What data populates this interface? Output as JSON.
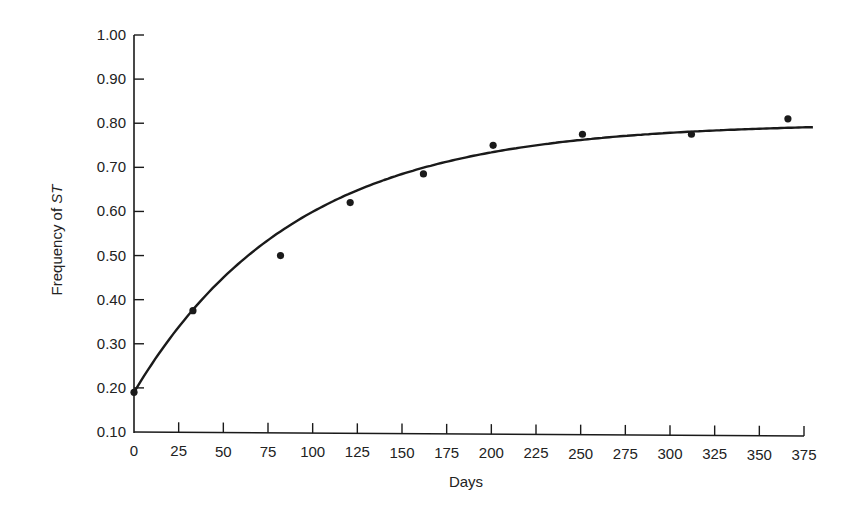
{
  "chart_data": {
    "type": "scatter",
    "title": "",
    "xlabel": "Days",
    "ylabel": "Frequency of ST",
    "ylabel_parts": {
      "prefix": "Frequency of ",
      "italic": "ST"
    },
    "xlim": [
      0,
      375
    ],
    "ylim": [
      0.1,
      1.0
    ],
    "grid": false,
    "legend": null,
    "x_ticks": [
      0,
      25,
      50,
      75,
      100,
      125,
      150,
      175,
      200,
      225,
      250,
      275,
      300,
      325,
      350,
      375
    ],
    "y_ticks": [
      "0.10",
      "0.20",
      "0.30",
      "0.40",
      "0.50",
      "0.60",
      "0.70",
      "0.80",
      "0.90",
      "1.00"
    ],
    "series": [
      {
        "name": "Observed frequency",
        "kind": "points",
        "x": [
          0,
          33,
          82,
          121,
          162,
          201,
          251,
          312,
          366
        ],
        "y": [
          0.19,
          0.375,
          0.5,
          0.62,
          0.685,
          0.75,
          0.775,
          0.775,
          0.81
        ]
      },
      {
        "name": "Fitted curve",
        "kind": "line",
        "x": [
          0,
          25,
          50,
          75,
          100,
          125,
          150,
          175,
          200,
          225,
          250,
          275,
          300,
          325,
          350,
          375
        ],
        "y": [
          0.19,
          0.34,
          0.45,
          0.537,
          0.603,
          0.652,
          0.687,
          0.714,
          0.734,
          0.75,
          0.762,
          0.772,
          0.778,
          0.783,
          0.788,
          0.791
        ]
      }
    ]
  },
  "colors": {
    "ink": "#1a1a1a",
    "background": "#ffffff"
  }
}
